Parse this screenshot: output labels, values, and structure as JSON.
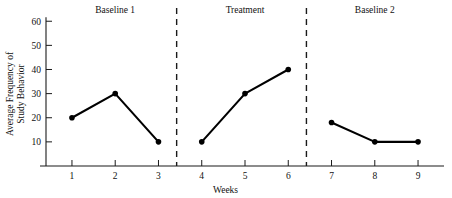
{
  "chart_data": {
    "type": "line",
    "title": "",
    "xlabel": "Weeks",
    "ylabel_line1": "Average Frequency of",
    "ylabel_line2": "Study Behavior",
    "ylabel": "Average Frequency of Study Behavior",
    "x": [
      1,
      2,
      3,
      4,
      5,
      6,
      7,
      8,
      9
    ],
    "xticklabels": [
      "1",
      "2",
      "3",
      "4",
      "5",
      "6",
      "7",
      "8",
      "9"
    ],
    "yticks": [
      10,
      20,
      30,
      40,
      50,
      60
    ],
    "yticklabels": [
      "10",
      "20",
      "30",
      "40",
      "50",
      "60"
    ],
    "xlim": [
      0.4,
      9.6
    ],
    "ylim": [
      0,
      63
    ],
    "grid": false,
    "legend": false,
    "series": [
      {
        "name": "Baseline 1",
        "x": [
          1,
          2,
          3
        ],
        "values": [
          20,
          30,
          10
        ]
      },
      {
        "name": "Treatment",
        "x": [
          4,
          5,
          6
        ],
        "values": [
          10,
          30,
          40
        ]
      },
      {
        "name": "Baseline 2",
        "x": [
          7,
          8,
          9
        ],
        "values": [
          18,
          10,
          10
        ]
      }
    ],
    "phases": [
      {
        "label": "Baseline 1",
        "center_x": 2.0
      },
      {
        "label": "Treatment",
        "center_x": 5.0
      },
      {
        "label": "Baseline 2",
        "center_x": 8.0
      }
    ],
    "phase_dividers": [
      3.42,
      6.42
    ],
    "marker": "filled-circle",
    "line_color": "#000000",
    "marker_color": "#000000",
    "axis_color": "#1a1a1a",
    "background_color": "#ffffff"
  }
}
